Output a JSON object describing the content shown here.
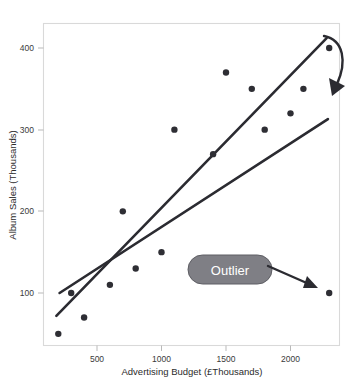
{
  "chart_data": {
    "type": "scatter",
    "title": "",
    "xlabel": "Advertising Budget (£Thousands)",
    "ylabel": "Album Sales (Thousands)",
    "xlim": [
      100,
      2400
    ],
    "ylim": [
      30,
      425
    ],
    "xticks": [
      500,
      1000,
      1500,
      2000
    ],
    "xtick_labels": [
      "500",
      "1000",
      "1500",
      "2000"
    ],
    "yticks": [
      100,
      200,
      300,
      400
    ],
    "ytick_labels": [
      "100",
      "200",
      "300",
      "400"
    ],
    "grid": false,
    "legend": "none",
    "point_color": "#2e2e34",
    "line_color": "#2b2b31",
    "points": [
      {
        "x": 200,
        "y": 50
      },
      {
        "x": 300,
        "y": 100
      },
      {
        "x": 400,
        "y": 70
      },
      {
        "x": 600,
        "y": 110
      },
      {
        "x": 700,
        "y": 200
      },
      {
        "x": 800,
        "y": 130
      },
      {
        "x": 1000,
        "y": 150
      },
      {
        "x": 1100,
        "y": 300
      },
      {
        "x": 1400,
        "y": 270
      },
      {
        "x": 1500,
        "y": 370
      },
      {
        "x": 1700,
        "y": 350
      },
      {
        "x": 1800,
        "y": 300
      },
      {
        "x": 2000,
        "y": 320
      },
      {
        "x": 2100,
        "y": 350
      },
      {
        "x": 2300,
        "y": 400
      },
      {
        "x": 2300,
        "y": 100
      }
    ],
    "lines": [
      {
        "name": "regression-with-outlier",
        "x0": 210,
        "y0": 100,
        "x1": 2290,
        "y1": 313
      },
      {
        "name": "regression-without-outlier",
        "x0": 185,
        "y0": 72,
        "x1": 2280,
        "y1": 412
      }
    ],
    "annotations": [
      {
        "name": "outlier-label",
        "text": "Outlier",
        "shape": "rounded-pill",
        "fill": "#7f7f85",
        "text_color": "#ffffff",
        "points_to": {
          "x": 2300,
          "y": 100
        }
      },
      {
        "name": "line-callout-arrow",
        "text": "",
        "shape": "curved-arrow",
        "color": "#2b2b31"
      }
    ]
  },
  "axes": {
    "x_title": "Advertising Budget (£Thousands)",
    "y_title": "Album Sales (Thousands)",
    "x_tick_labels": [
      "500",
      "1000",
      "1500",
      "2000"
    ],
    "y_tick_labels": [
      "100",
      "200",
      "300",
      "400"
    ]
  },
  "labels": {
    "outlier": "Outlier"
  }
}
